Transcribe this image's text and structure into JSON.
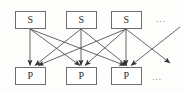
{
  "figure": {
    "type": "bipartite-graph-diagram",
    "background_color": "#fdfdfc",
    "edge_color": "#4a4a4a",
    "box_border_color": "#6d6d6d",
    "box_fill_color": "#ffffff",
    "label_color": "#2b2b2b"
  },
  "top_row": {
    "name": "source-layer",
    "nodes": [
      {
        "id": "s1",
        "label": "S"
      },
      {
        "id": "s2",
        "label": "S"
      },
      {
        "id": "s3",
        "label": "S"
      }
    ],
    "ellipsis": "..."
  },
  "bottom_row": {
    "name": "target-layer",
    "nodes": [
      {
        "id": "p1",
        "label": "P"
      },
      {
        "id": "p2",
        "label": "P"
      },
      {
        "id": "p3",
        "label": "P"
      }
    ],
    "ellipsis": "..."
  },
  "edges": [
    {
      "from": "s1",
      "to": "p1"
    },
    {
      "from": "s1",
      "to": "p2"
    },
    {
      "from": "s1",
      "to": "p3"
    },
    {
      "from": "s2",
      "to": "p1"
    },
    {
      "from": "s2",
      "to": "p2"
    },
    {
      "from": "s2",
      "to": "p3"
    },
    {
      "from": "s3",
      "to": "p1"
    },
    {
      "from": "s3",
      "to": "p2"
    },
    {
      "from": "s3",
      "to": "p3"
    },
    {
      "from": "s3",
      "to": "more-targets"
    },
    {
      "from": "more-sources",
      "to": "p3"
    }
  ]
}
